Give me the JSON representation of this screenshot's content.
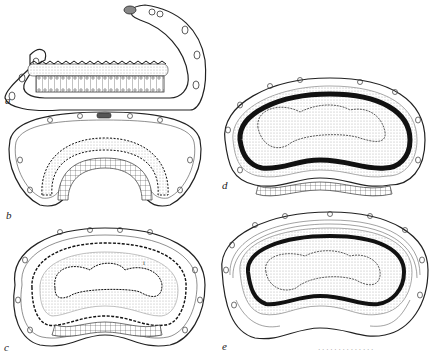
{
  "figure": {
    "panels": [
      {
        "label": "a",
        "description": "flat open stage: thin cellular outer layer loop with flat epithelium strip"
      },
      {
        "label": "b",
        "description": "curved stage with arched epithelium and spiny inner layer"
      },
      {
        "label": "c",
        "description": "kidney-shaped stage with spiny inner layer and folded lumen"
      },
      {
        "label": "d",
        "description": "kidney-shaped stage with thick dark band and folded lumen"
      },
      {
        "label": "e",
        "description": "kidney-shaped stage with thick dark band, stippled layer and fibrous outer wrapping"
      }
    ],
    "inner_label": "i",
    "caption_fragment": "· · · · · · · · · · · · · ·"
  },
  "colors": {
    "line": "#222222",
    "stipple": "#c8c8c8",
    "dark_band": "#111111",
    "background": "#ffffff"
  }
}
